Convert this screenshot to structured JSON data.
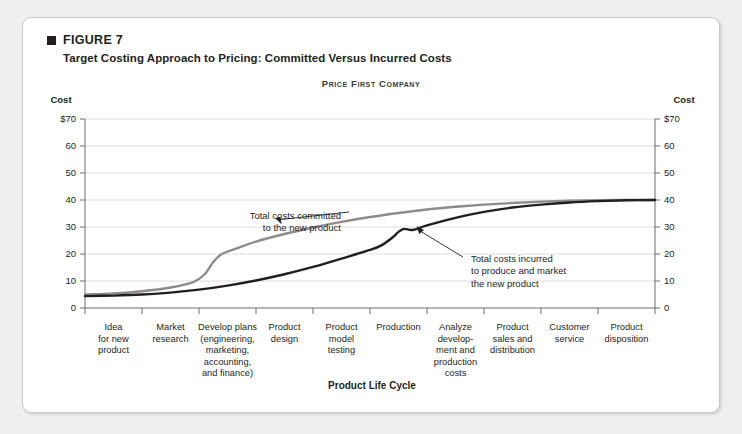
{
  "figure": {
    "label": "FIGURE 7",
    "title": "Target Costing Approach to Pricing: Committed Versus Incurred Costs",
    "company": "Price First Company"
  },
  "chart_data": {
    "type": "line",
    "title": "Price First Company",
    "xlabel": "Product Life Cycle",
    "ylabel": "Cost",
    "ylabel_right": "Cost",
    "ylim": [
      0,
      70
    ],
    "yticks": [
      0,
      10,
      20,
      30,
      40,
      50,
      60,
      70
    ],
    "ytick_labels": [
      "0",
      "10",
      "20",
      "30",
      "40",
      "50",
      "60",
      "$70"
    ],
    "ytick_labels_right": [
      "0",
      "10",
      "20",
      "30",
      "40",
      "50",
      "60",
      "$70"
    ],
    "grid": true,
    "legend": "none",
    "categories": [
      "Idea for new product",
      "Market research",
      "Develop plans (engineering, marketing, accounting, and finance)",
      "Product design",
      "Product model testing",
      "Production",
      "Analyze develop-ment and production costs",
      "Product sales and distribution",
      "Customer service",
      "Product disposition"
    ],
    "category_lines": [
      [
        "Idea",
        "for new",
        "product"
      ],
      [
        "Market",
        "research"
      ],
      [
        "Develop plans",
        "(engineering,",
        "marketing,",
        "accounting,",
        "and finance)"
      ],
      [
        "Product",
        "design"
      ],
      [
        "Product",
        "model",
        "testing"
      ],
      [
        "Production"
      ],
      [
        "Analyze",
        "develop-",
        "ment and",
        "production",
        "costs"
      ],
      [
        "Product",
        "sales and",
        "distribution"
      ],
      [
        "Customer",
        "service"
      ],
      [
        "Product",
        "disposition"
      ]
    ],
    "series": [
      {
        "name": "Total costs committed to the new product",
        "color": "#8c8c8c",
        "x": [
          0.0,
          0.5,
          1.0,
          1.5,
          1.9,
          2.1,
          2.25,
          2.4,
          2.6,
          3.0,
          3.5,
          4.0,
          4.5,
          5.0,
          5.5,
          6.0,
          6.5,
          7.0,
          7.5,
          8.0,
          8.5,
          9.0,
          9.5,
          10.0
        ],
        "values": [
          5.0,
          5.4,
          6.2,
          7.6,
          9.6,
          12.5,
          17.0,
          20.0,
          21.6,
          24.6,
          27.4,
          29.8,
          31.9,
          33.7,
          35.2,
          36.5,
          37.5,
          38.3,
          38.9,
          39.4,
          39.7,
          39.9,
          40.0,
          40.0
        ]
      },
      {
        "name": "Total costs incurred to produce and market the new product",
        "color": "#231f20",
        "x": [
          0.0,
          0.5,
          1.0,
          1.5,
          2.0,
          2.5,
          3.0,
          3.5,
          4.0,
          4.5,
          5.0,
          5.2,
          5.4,
          5.5,
          5.6,
          5.75,
          6.0,
          6.5,
          7.0,
          7.5,
          8.0,
          8.5,
          9.0,
          9.5,
          10.0
        ],
        "values": [
          4.4,
          4.6,
          5.0,
          5.7,
          6.8,
          8.3,
          10.2,
          12.5,
          15.2,
          18.3,
          21.5,
          23.2,
          26.2,
          28.2,
          29.3,
          28.9,
          30.6,
          33.4,
          35.6,
          37.2,
          38.3,
          39.1,
          39.6,
          39.9,
          40.0
        ]
      }
    ],
    "annotations": [
      {
        "name": "committed-costs-annotation",
        "lines": [
          "Total costs committed",
          "to the new product"
        ],
        "text": "Total costs committed to the new product",
        "target_x": 3.45,
        "target_y": 31.0
      },
      {
        "name": "incurred-costs-annotation",
        "lines": [
          "Total costs incurred",
          "to produce and market",
          "the new product"
        ],
        "text": "Total costs incurred to produce and market the new product",
        "target_x": 5.82,
        "target_y": 30.4
      }
    ]
  }
}
